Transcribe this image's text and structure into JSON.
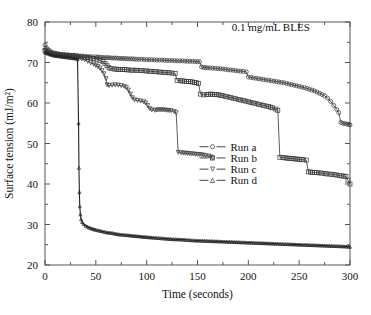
{
  "figure": {
    "annotation": "0.1 mg/mL BLES",
    "background": "#ffffff",
    "frame_color": "#555555"
  },
  "chart_data": {
    "type": "line",
    "title": "",
    "subtitle": "",
    "annotations": [
      {
        "text": "0.1 mg/mL BLES",
        "x": 222,
        "y": 77.8
      }
    ],
    "xlabel": "Time (seconds)",
    "ylabel": "Surface tension (mJ/m²)",
    "xlim": [
      0,
      300
    ],
    "ylim": [
      20,
      80
    ],
    "xticks": [
      0,
      50,
      100,
      150,
      200,
      250,
      300
    ],
    "xticklabels": [
      "0",
      "50",
      "100",
      "150",
      "200",
      "250",
      "300"
    ],
    "xminor_step": 25,
    "yticks": [
      20,
      30,
      40,
      50,
      60,
      70,
      80
    ],
    "yticklabels": [
      "20",
      "30",
      "40",
      "50",
      "60",
      "70",
      "80"
    ],
    "yminor_step": 5,
    "grid": false,
    "legend_position": "center",
    "legend": [
      {
        "label": "Run a",
        "marker": "circle"
      },
      {
        "label": "Run b",
        "marker": "square"
      },
      {
        "label": "Run c",
        "marker": "triangle-down"
      },
      {
        "label": "Run d",
        "marker": "triangle-up"
      }
    ],
    "series": [
      {
        "name": "Run a",
        "marker": "circle",
        "color": "#333333",
        "points": [
          [
            0,
            74.3
          ],
          [
            1.5,
            73.6
          ],
          [
            3,
            73.2
          ],
          [
            4.5,
            72.9
          ],
          [
            6,
            72.6
          ],
          [
            8,
            72.4
          ],
          [
            10,
            72.3
          ],
          [
            12,
            72.2
          ],
          [
            14,
            72.1
          ],
          [
            16,
            72.0
          ],
          [
            18,
            72.0
          ],
          [
            20,
            71.9
          ],
          [
            23,
            71.9
          ],
          [
            26,
            71.8
          ],
          [
            29,
            71.8
          ],
          [
            32,
            71.7
          ],
          [
            35,
            71.6
          ],
          [
            38,
            71.6
          ],
          [
            41,
            71.5
          ],
          [
            44,
            71.5
          ],
          [
            47,
            71.4
          ],
          [
            50,
            71.4
          ],
          [
            54,
            71.3
          ],
          [
            58,
            71.2
          ],
          [
            62,
            71.2
          ],
          [
            66,
            71.1
          ],
          [
            70,
            71.1
          ],
          [
            74,
            71.0
          ],
          [
            78,
            71.0
          ],
          [
            82,
            70.9
          ],
          [
            86,
            70.9
          ],
          [
            90,
            70.8
          ],
          [
            95,
            70.8
          ],
          [
            100,
            70.7
          ],
          [
            105,
            70.7
          ],
          [
            110,
            70.6
          ],
          [
            115,
            70.6
          ],
          [
            120,
            70.5
          ],
          [
            125,
            70.5
          ],
          [
            130,
            70.4
          ],
          [
            135,
            70.4
          ],
          [
            140,
            70.3
          ],
          [
            145,
            70.3
          ],
          [
            150,
            70.2
          ],
          [
            152,
            70.2
          ],
          [
            154,
            68.9
          ],
          [
            156,
            68.8
          ],
          [
            160,
            68.7
          ],
          [
            165,
            68.6
          ],
          [
            170,
            68.5
          ],
          [
            175,
            68.4
          ],
          [
            180,
            68.2
          ],
          [
            185,
            68.1
          ],
          [
            190,
            67.9
          ],
          [
            195,
            67.8
          ],
          [
            198,
            67.7
          ],
          [
            200,
            66.4
          ],
          [
            205,
            66.2
          ],
          [
            210,
            66.0
          ],
          [
            215,
            65.8
          ],
          [
            220,
            65.6
          ],
          [
            225,
            65.4
          ],
          [
            230,
            65.2
          ],
          [
            235,
            65.0
          ],
          [
            240,
            64.7
          ],
          [
            245,
            64.4
          ],
          [
            250,
            64.1
          ],
          [
            255,
            63.8
          ],
          [
            260,
            63.4
          ],
          [
            265,
            63.0
          ],
          [
            270,
            62.4
          ],
          [
            275,
            61.8
          ],
          [
            278,
            61.2
          ],
          [
            281,
            60.4
          ],
          [
            284,
            59.4
          ],
          [
            287,
            58.4
          ],
          [
            289,
            57.6
          ],
          [
            291,
            55.2
          ],
          [
            293,
            55.0
          ],
          [
            295,
            54.9
          ],
          [
            297,
            54.8
          ],
          [
            299,
            54.7
          ],
          [
            300,
            54.6
          ]
        ]
      },
      {
        "name": "Run b",
        "marker": "square",
        "color": "#333333",
        "points": [
          [
            0,
            73.0
          ],
          [
            2,
            72.6
          ],
          [
            4,
            72.4
          ],
          [
            6,
            72.2
          ],
          [
            9,
            72.1
          ],
          [
            12,
            72.0
          ],
          [
            15,
            71.9
          ],
          [
            18,
            71.8
          ],
          [
            21,
            71.8
          ],
          [
            24,
            71.7
          ],
          [
            27,
            71.7
          ],
          [
            30,
            71.6
          ],
          [
            33,
            71.5
          ],
          [
            36,
            71.4
          ],
          [
            39,
            71.3
          ],
          [
            42,
            71.2
          ],
          [
            45,
            71.1
          ],
          [
            48,
            71.0
          ],
          [
            51,
            70.8
          ],
          [
            54,
            70.5
          ],
          [
            57,
            70.2
          ],
          [
            59,
            69.8
          ],
          [
            61,
            69.2
          ],
          [
            63,
            68.7
          ],
          [
            65,
            68.5
          ],
          [
            68,
            68.4
          ],
          [
            72,
            68.3
          ],
          [
            76,
            68.3
          ],
          [
            80,
            68.2
          ],
          [
            85,
            68.1
          ],
          [
            90,
            68.1
          ],
          [
            95,
            68.0
          ],
          [
            100,
            67.9
          ],
          [
            105,
            67.8
          ],
          [
            110,
            67.7
          ],
          [
            115,
            67.6
          ],
          [
            120,
            67.5
          ],
          [
            125,
            67.4
          ],
          [
            128,
            67.3
          ],
          [
            130,
            65.6
          ],
          [
            133,
            65.5
          ],
          [
            137,
            65.4
          ],
          [
            141,
            65.3
          ],
          [
            145,
            65.2
          ],
          [
            149,
            65.0
          ],
          [
            151,
            64.8
          ],
          [
            153,
            62.2
          ],
          [
            156,
            62.0
          ],
          [
            159,
            62.1
          ],
          [
            163,
            62.2
          ],
          [
            167,
            62.1
          ],
          [
            171,
            62.0
          ],
          [
            175,
            61.8
          ],
          [
            180,
            61.5
          ],
          [
            185,
            61.2
          ],
          [
            190,
            60.9
          ],
          [
            195,
            60.6
          ],
          [
            200,
            60.3
          ],
          [
            205,
            60.0
          ],
          [
            210,
            59.7
          ],
          [
            215,
            59.4
          ],
          [
            220,
            59.1
          ],
          [
            224,
            58.8
          ],
          [
            227,
            58.5
          ],
          [
            229,
            58.2
          ],
          [
            231,
            46.6
          ],
          [
            234,
            46.5
          ],
          [
            238,
            46.4
          ],
          [
            242,
            46.3
          ],
          [
            246,
            46.2
          ],
          [
            250,
            46.1
          ],
          [
            254,
            46.0
          ],
          [
            257,
            45.9
          ],
          [
            259,
            43.0
          ],
          [
            263,
            42.9
          ],
          [
            267,
            42.8
          ],
          [
            272,
            42.7
          ],
          [
            277,
            42.5
          ],
          [
            282,
            42.4
          ],
          [
            287,
            42.2
          ],
          [
            292,
            42.0
          ],
          [
            296,
            41.9
          ],
          [
            300,
            40.0
          ]
        ]
      },
      {
        "name": "Run c",
        "marker": "triangle-down",
        "color": "#333333",
        "points": [
          [
            0,
            72.8
          ],
          [
            3,
            72.4
          ],
          [
            6,
            72.1
          ],
          [
            9,
            71.9
          ],
          [
            12,
            71.8
          ],
          [
            15,
            71.7
          ],
          [
            18,
            71.6
          ],
          [
            21,
            71.5
          ],
          [
            24,
            71.4
          ],
          [
            27,
            71.3
          ],
          [
            30,
            71.2
          ],
          [
            33,
            71.1
          ],
          [
            36,
            70.9
          ],
          [
            39,
            70.7
          ],
          [
            42,
            70.3
          ],
          [
            45,
            69.9
          ],
          [
            48,
            69.6
          ],
          [
            50,
            69.3
          ],
          [
            52,
            69.0
          ],
          [
            54,
            68.6
          ],
          [
            56,
            68.0
          ],
          [
            58,
            67.2
          ],
          [
            60,
            66.0
          ],
          [
            61,
            64.5
          ],
          [
            63,
            64.3
          ],
          [
            66,
            64.4
          ],
          [
            69,
            64.5
          ],
          [
            72,
            64.4
          ],
          [
            75,
            64.3
          ],
          [
            78,
            64.1
          ],
          [
            80,
            63.8
          ],
          [
            82,
            63.2
          ],
          [
            84,
            62.2
          ],
          [
            86,
            61.3
          ],
          [
            88,
            60.8
          ],
          [
            91,
            60.6
          ],
          [
            94,
            60.5
          ],
          [
            97,
            60.3
          ],
          [
            99,
            60.0
          ],
          [
            101,
            59.4
          ],
          [
            103,
            58.6
          ],
          [
            105,
            58.3
          ],
          [
            108,
            58.2
          ],
          [
            112,
            58.3
          ],
          [
            116,
            58.3
          ],
          [
            120,
            58.2
          ],
          [
            124,
            58.1
          ],
          [
            127,
            57.9
          ],
          [
            129,
            57.6
          ],
          [
            131,
            47.8
          ],
          [
            134,
            47.7
          ],
          [
            138,
            47.6
          ],
          [
            142,
            47.5
          ],
          [
            146,
            47.4
          ],
          [
            150,
            47.3
          ],
          [
            154,
            47.2
          ],
          [
            158,
            47.0
          ],
          [
            161,
            46.9
          ],
          [
            163,
            46.7
          ],
          [
            165,
            46.4
          ]
        ]
      },
      {
        "name": "Run d",
        "marker": "triangle-up",
        "color": "#222222",
        "points": [
          [
            0,
            72.5
          ],
          [
            3,
            72.2
          ],
          [
            6,
            71.9
          ],
          [
            9,
            71.7
          ],
          [
            12,
            71.6
          ],
          [
            15,
            71.5
          ],
          [
            18,
            71.4
          ],
          [
            21,
            71.3
          ],
          [
            24,
            71.2
          ],
          [
            27,
            71.1
          ],
          [
            30,
            71.0
          ],
          [
            32,
            70.8
          ],
          [
            33,
            55.0
          ],
          [
            33.4,
            44.0
          ],
          [
            33.8,
            38.0
          ],
          [
            34.2,
            34.5
          ],
          [
            34.8,
            32.5
          ],
          [
            35.5,
            31.3
          ],
          [
            36.5,
            30.6
          ],
          [
            38,
            30.1
          ],
          [
            40,
            29.7
          ],
          [
            43,
            29.3
          ],
          [
            46,
            29.0
          ],
          [
            50,
            28.7
          ],
          [
            55,
            28.4
          ],
          [
            60,
            28.1
          ],
          [
            66,
            27.9
          ],
          [
            72,
            27.6
          ],
          [
            80,
            27.4
          ],
          [
            88,
            27.2
          ],
          [
            96,
            27.0
          ],
          [
            105,
            26.8
          ],
          [
            115,
            26.6
          ],
          [
            125,
            26.4
          ],
          [
            135,
            26.3
          ],
          [
            145,
            26.1
          ],
          [
            155,
            26.0
          ],
          [
            165,
            25.9
          ],
          [
            175,
            25.8
          ],
          [
            185,
            25.7
          ],
          [
            195,
            25.6
          ],
          [
            205,
            25.5
          ],
          [
            215,
            25.4
          ],
          [
            225,
            25.3
          ],
          [
            235,
            25.2
          ],
          [
            245,
            25.1
          ],
          [
            255,
            25.0
          ],
          [
            265,
            24.9
          ],
          [
            275,
            24.8
          ],
          [
            285,
            24.7
          ],
          [
            295,
            24.6
          ],
          [
            300,
            24.5
          ]
        ]
      }
    ]
  }
}
